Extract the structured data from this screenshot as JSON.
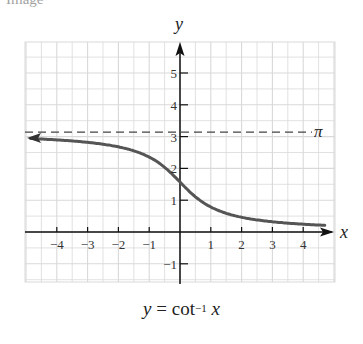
{
  "header_fragment": "Image",
  "caption": {
    "lhs": "y",
    "eq": "=",
    "func": "cot",
    "exp": "−1",
    "arg": "x"
  },
  "chart_data": {
    "type": "line",
    "xlabel": "x",
    "ylabel": "y",
    "xlim": [
      -5,
      5
    ],
    "ylim": [
      -1.5,
      6
    ],
    "grid": true,
    "grid_step": 0.5,
    "x_ticks": [
      -4,
      -3,
      -2,
      -1,
      1,
      2,
      3,
      4
    ],
    "x_tick_labels": [
      "−4",
      "−3",
      "−2",
      "−1",
      "1",
      "2",
      "3",
      "4"
    ],
    "y_ticks": [
      -1,
      1,
      2,
      3,
      4,
      5
    ],
    "y_tick_labels": [
      "−1",
      "1",
      "2",
      "3",
      "4",
      "5"
    ],
    "series": [
      {
        "name": "y = cot⁻¹ x",
        "color": "#555555",
        "style": "solid",
        "x": [
          -4.9,
          -4,
          -3,
          -2,
          -1,
          -0.5,
          0,
          0.5,
          1,
          2,
          3,
          4,
          4.6
        ],
        "y": [
          2.94,
          2.9,
          2.82,
          2.68,
          2.36,
          2.03,
          1.57,
          1.11,
          0.79,
          0.46,
          0.32,
          0.24,
          0.21
        ]
      }
    ],
    "annotations": [
      {
        "type": "asymptote",
        "y": 3.14159,
        "label": "π",
        "style": "dashed"
      },
      {
        "type": "asymptote",
        "y": 0,
        "label": "",
        "style": "axis"
      }
    ],
    "legend": null
  },
  "colors": {
    "grid": "#d9d9d9",
    "axis": "#111111",
    "curve": "#555555",
    "dashed": "#444444"
  }
}
